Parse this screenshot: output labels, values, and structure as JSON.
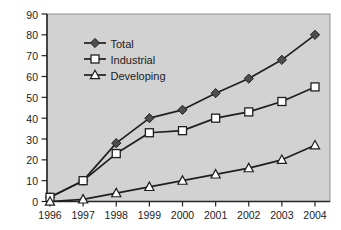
{
  "page": {
    "background": "#ffffff"
  },
  "chart_data": {
    "type": "line",
    "title": "",
    "xlabel": "",
    "ylabel": "",
    "x": [
      "1996",
      "1997",
      "1998",
      "1999",
      "2000",
      "2001",
      "2002",
      "2003",
      "2004"
    ],
    "series": [
      {
        "name": "Total",
        "marker": "diamond",
        "marker_fill": "#4d4d4d",
        "values": [
          2,
          10,
          28,
          40,
          44,
          52,
          59,
          68,
          80
        ]
      },
      {
        "name": "Industrial",
        "marker": "square",
        "marker_fill": "#ffffff",
        "values": [
          2,
          10,
          23,
          33,
          34,
          40,
          43,
          48,
          55
        ]
      },
      {
        "name": "Developing",
        "marker": "triangle",
        "marker_fill": "#ffffff",
        "values": [
          0,
          1,
          4,
          7,
          10,
          13,
          16,
          20,
          27
        ]
      }
    ],
    "ylim": [
      0,
      90
    ],
    "y_ticks": [
      0,
      10,
      20,
      30,
      40,
      50,
      60,
      70,
      80,
      90
    ],
    "grid": false,
    "legend_position": "upper-left-inside",
    "colors": {
      "plot_background": "#d2d2d2",
      "line": "#1f1f1f",
      "axis": "#262626",
      "plot_border": "#8f8f8f",
      "text": "#1c1c1c"
    }
  }
}
